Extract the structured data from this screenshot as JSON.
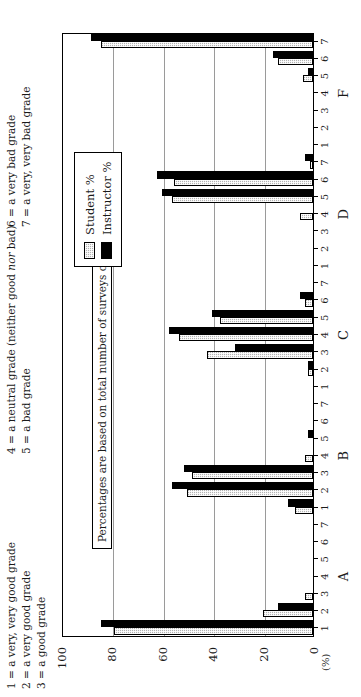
{
  "key_legend": {
    "column1": [
      "1 = a very, very good grade",
      "2 = a very good grade",
      "3 = a good grade"
    ],
    "column2": [
      "4 = a neutral grade (neither good nor bad)",
      "5 = a bad grade"
    ],
    "column3": [
      "6 = a very bad grade",
      "7 = a very, very bad grade"
    ]
  },
  "annotation": "Percentages are based on total number of surveys completed.",
  "legend": {
    "entries": [
      {
        "label": "Student %",
        "color": "#b3b3b3",
        "pattern": "hatched"
      },
      {
        "label": "Instructor %",
        "color": "#000000",
        "pattern": "solid"
      }
    ]
  },
  "chart_data": {
    "type": "bar",
    "title": "",
    "xlabel": "",
    "ylabel": "(%)",
    "ylim": [
      0,
      100
    ],
    "yticks": [
      0,
      20,
      40,
      60,
      80,
      100
    ],
    "grid": true,
    "legend_position": "upper-right",
    "groups": [
      "A",
      "B",
      "C",
      "D",
      "F"
    ],
    "ratings": [
      1,
      2,
      3,
      4,
      5,
      6,
      7
    ],
    "categories": [
      "A1",
      "A2",
      "A3",
      "A4",
      "A5",
      "A6",
      "A7",
      "B1",
      "B2",
      "B3",
      "B4",
      "B5",
      "B6",
      "B7",
      "C1",
      "C2",
      "C3",
      "C4",
      "C5",
      "C6",
      "C7",
      "D1",
      "D2",
      "D3",
      "D4",
      "D5",
      "D6",
      "D7",
      "F1",
      "F2",
      "F3",
      "F4",
      "F5",
      "F6",
      "F7"
    ],
    "series": [
      {
        "name": "Student %",
        "color": "#b3b3b3",
        "values": [
          79,
          20,
          3,
          0,
          0,
          0,
          0,
          7,
          50,
          48,
          3,
          0,
          0,
          0,
          0,
          2,
          42,
          53,
          37,
          3,
          0,
          0,
          0,
          0,
          5,
          56,
          55,
          1,
          0,
          0,
          0,
          0,
          4,
          14,
          84
        ]
      },
      {
        "name": "Instructor %",
        "color": "#000000",
        "values": [
          84,
          14,
          0,
          0,
          0,
          0,
          0,
          10,
          56,
          51,
          0,
          2,
          0,
          0,
          0,
          2,
          31,
          57,
          40,
          5,
          0,
          0,
          0,
          0,
          0,
          60,
          62,
          3,
          0,
          0,
          0,
          0,
          2,
          16,
          88
        ]
      }
    ]
  }
}
